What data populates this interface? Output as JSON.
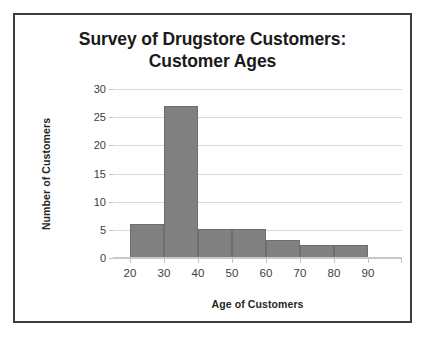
{
  "figure": {
    "title_lines": [
      "Survey of Drugstore Customers:",
      "Customer Ages"
    ],
    "frame_color": "#3d3d3d",
    "background": "#ffffff"
  },
  "chart_data": {
    "type": "bar",
    "title": "Survey of Drugstore Customers: Customer Ages",
    "xlabel": "Age of Customers",
    "ylabel": "Number of Customers",
    "xlim": [
      15,
      100
    ],
    "ylim": [
      0,
      30
    ],
    "grid": true,
    "legend": null,
    "bar_color": "#808080",
    "bar_edge_color": "#6e6e6e",
    "xticks": [
      20,
      30,
      40,
      50,
      60,
      70,
      80,
      90
    ],
    "xtick_labels": [
      "20",
      "30",
      "40",
      "50",
      "60",
      "70",
      "80",
      "90"
    ],
    "yticks": [
      0,
      5,
      10,
      15,
      20,
      25,
      30
    ],
    "ytick_labels": [
      "0",
      "5",
      "10",
      "15",
      "20",
      "25",
      "30"
    ],
    "bin_edges": [
      20,
      30,
      40,
      50,
      60,
      70,
      80,
      90
    ],
    "categories": [
      "20-30",
      "30-40",
      "40-50",
      "50-60",
      "60-70",
      "70-80",
      "80-90"
    ],
    "values": [
      6,
      27,
      5.2,
      5.2,
      3.2,
      2.3,
      2.3
    ]
  }
}
